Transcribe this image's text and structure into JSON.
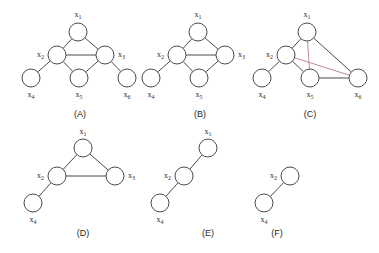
{
  "figure": {
    "background_color": "#ffffff",
    "node_stroke_color": "#4b4b4b",
    "node_fill_color": "#ffffff",
    "edge_color": "#4b4b4b",
    "accent_edge_color": "#c08a96",
    "node_radius": 9,
    "panels": [
      {
        "id": "A",
        "caption": "(A)",
        "caption_x": 80,
        "caption_y": 117,
        "nodes": [
          {
            "id": "x1",
            "label_base": "x",
            "label_sub": "1",
            "cx": 78,
            "cy": 32,
            "label_x": 78,
            "label_y": 17,
            "label_anchor": "middle"
          },
          {
            "id": "x2",
            "label_base": "x",
            "label_sub": "2",
            "cx": 57,
            "cy": 55,
            "label_x": 44,
            "label_y": 57,
            "label_anchor": "end"
          },
          {
            "id": "x3",
            "label_base": "x",
            "label_sub": "3",
            "cx": 105,
            "cy": 55,
            "label_x": 118,
            "label_y": 57,
            "label_anchor": "start"
          },
          {
            "id": "x4",
            "label_base": "x",
            "label_sub": "4",
            "cx": 31,
            "cy": 78,
            "label_x": 31,
            "label_y": 97,
            "label_anchor": "middle"
          },
          {
            "id": "x5",
            "label_base": "x",
            "label_sub": "5",
            "cx": 79,
            "cy": 78,
            "label_x": 79,
            "label_y": 97,
            "label_anchor": "middle"
          },
          {
            "id": "x6",
            "label_base": "x",
            "label_sub": "6",
            "cx": 127,
            "cy": 78,
            "label_x": 127,
            "label_y": 97,
            "label_anchor": "middle"
          }
        ],
        "edges": [
          {
            "from": "x1",
            "to": "x2",
            "accent": false
          },
          {
            "from": "x1",
            "to": "x3",
            "accent": false
          },
          {
            "from": "x2",
            "to": "x3",
            "accent": false
          },
          {
            "from": "x2",
            "to": "x4",
            "accent": false
          },
          {
            "from": "x2",
            "to": "x5",
            "accent": false
          },
          {
            "from": "x3",
            "to": "x5",
            "accent": false
          },
          {
            "from": "x3",
            "to": "x6",
            "accent": false
          }
        ]
      },
      {
        "id": "B",
        "caption": "(B)",
        "caption_x": 200,
        "caption_y": 117,
        "nodes": [
          {
            "id": "x1",
            "label_base": "x",
            "label_sub": "1",
            "cx": 198,
            "cy": 32,
            "label_x": 198,
            "label_y": 17,
            "label_anchor": "middle"
          },
          {
            "id": "x2",
            "label_base": "x",
            "label_sub": "2",
            "cx": 177,
            "cy": 55,
            "label_x": 164,
            "label_y": 57,
            "label_anchor": "end"
          },
          {
            "id": "x3",
            "label_base": "x",
            "label_sub": "3",
            "cx": 225,
            "cy": 55,
            "label_x": 238,
            "label_y": 57,
            "label_anchor": "start"
          },
          {
            "id": "x4",
            "label_base": "x",
            "label_sub": "4",
            "cx": 151,
            "cy": 78,
            "label_x": 151,
            "label_y": 97,
            "label_anchor": "middle"
          },
          {
            "id": "x5",
            "label_base": "x",
            "label_sub": "5",
            "cx": 199,
            "cy": 78,
            "label_x": 199,
            "label_y": 97,
            "label_anchor": "middle"
          }
        ],
        "edges": [
          {
            "from": "x1",
            "to": "x2",
            "accent": false
          },
          {
            "from": "x1",
            "to": "x3",
            "accent": false
          },
          {
            "from": "x2",
            "to": "x3",
            "accent": false
          },
          {
            "from": "x2",
            "to": "x4",
            "accent": false
          },
          {
            "from": "x2",
            "to": "x5",
            "accent": false
          },
          {
            "from": "x3",
            "to": "x5",
            "accent": false
          }
        ]
      },
      {
        "id": "C",
        "caption": "(C)",
        "caption_x": 310,
        "caption_y": 117,
        "nodes": [
          {
            "id": "x1",
            "label_base": "x",
            "label_sub": "1",
            "cx": 307,
            "cy": 32,
            "label_x": 307,
            "label_y": 17,
            "label_anchor": "middle"
          },
          {
            "id": "x2",
            "label_base": "x",
            "label_sub": "2",
            "cx": 286,
            "cy": 55,
            "label_x": 273,
            "label_y": 57,
            "label_anchor": "end"
          },
          {
            "id": "x4",
            "label_base": "x",
            "label_sub": "4",
            "cx": 262,
            "cy": 78,
            "label_x": 262,
            "label_y": 97,
            "label_anchor": "middle"
          },
          {
            "id": "x5",
            "label_base": "x",
            "label_sub": "5",
            "cx": 310,
            "cy": 78,
            "label_x": 310,
            "label_y": 97,
            "label_anchor": "middle"
          },
          {
            "id": "x6",
            "label_base": "x",
            "label_sub": "6",
            "cx": 358,
            "cy": 78,
            "label_x": 358,
            "label_y": 97,
            "label_anchor": "middle"
          }
        ],
        "edges": [
          {
            "from": "x1",
            "to": "x2",
            "accent": false
          },
          {
            "from": "x1",
            "to": "x6",
            "accent": false
          },
          {
            "from": "x1",
            "to": "x5",
            "accent": true
          },
          {
            "from": "x2",
            "to": "x4",
            "accent": false
          },
          {
            "from": "x2",
            "to": "x5",
            "accent": false
          },
          {
            "from": "x2",
            "to": "x6",
            "accent": true
          },
          {
            "from": "x5",
            "to": "x6",
            "accent": false
          }
        ]
      },
      {
        "id": "D",
        "caption": "(D)",
        "caption_x": 83,
        "caption_y": 236,
        "nodes": [
          {
            "id": "x1",
            "label_base": "x",
            "label_sub": "1",
            "cx": 83,
            "cy": 148,
            "label_x": 83,
            "label_y": 134,
            "label_anchor": "middle"
          },
          {
            "id": "x2",
            "label_base": "x",
            "label_sub": "2",
            "cx": 57,
            "cy": 176,
            "label_x": 44,
            "label_y": 178,
            "label_anchor": "end"
          },
          {
            "id": "x3",
            "label_base": "x",
            "label_sub": "3",
            "cx": 115,
            "cy": 176,
            "label_x": 128,
            "label_y": 178,
            "label_anchor": "start"
          },
          {
            "id": "x4",
            "label_base": "x",
            "label_sub": "4",
            "cx": 33,
            "cy": 203,
            "label_x": 33,
            "label_y": 222,
            "label_anchor": "middle"
          }
        ],
        "edges": [
          {
            "from": "x1",
            "to": "x2",
            "accent": false
          },
          {
            "from": "x1",
            "to": "x3",
            "accent": false
          },
          {
            "from": "x2",
            "to": "x3",
            "accent": false
          },
          {
            "from": "x2",
            "to": "x4",
            "accent": false
          }
        ]
      },
      {
        "id": "E",
        "caption": "(E)",
        "caption_x": 208,
        "caption_y": 236,
        "nodes": [
          {
            "id": "x1",
            "label_base": "x",
            "label_sub": "1",
            "cx": 208,
            "cy": 148,
            "label_x": 208,
            "label_y": 134,
            "label_anchor": "middle"
          },
          {
            "id": "x2",
            "label_base": "x",
            "label_sub": "2",
            "cx": 184,
            "cy": 176,
            "label_x": 171,
            "label_y": 178,
            "label_anchor": "end"
          },
          {
            "id": "x4",
            "label_base": "x",
            "label_sub": "4",
            "cx": 160,
            "cy": 203,
            "label_x": 160,
            "label_y": 222,
            "label_anchor": "middle"
          }
        ],
        "edges": [
          {
            "from": "x1",
            "to": "x2",
            "accent": false
          },
          {
            "from": "x2",
            "to": "x4",
            "accent": false
          }
        ]
      },
      {
        "id": "F",
        "caption": "(F)",
        "caption_x": 277,
        "caption_y": 236,
        "nodes": [
          {
            "id": "x2",
            "label_base": "x",
            "label_sub": "2",
            "cx": 290,
            "cy": 176,
            "label_x": 277,
            "label_y": 178,
            "label_anchor": "end"
          },
          {
            "id": "x4",
            "label_base": "x",
            "label_sub": "4",
            "cx": 264,
            "cy": 203,
            "label_x": 264,
            "label_y": 222,
            "label_anchor": "middle"
          }
        ],
        "edges": [
          {
            "from": "x2",
            "to": "x4",
            "accent": false
          }
        ]
      }
    ]
  }
}
